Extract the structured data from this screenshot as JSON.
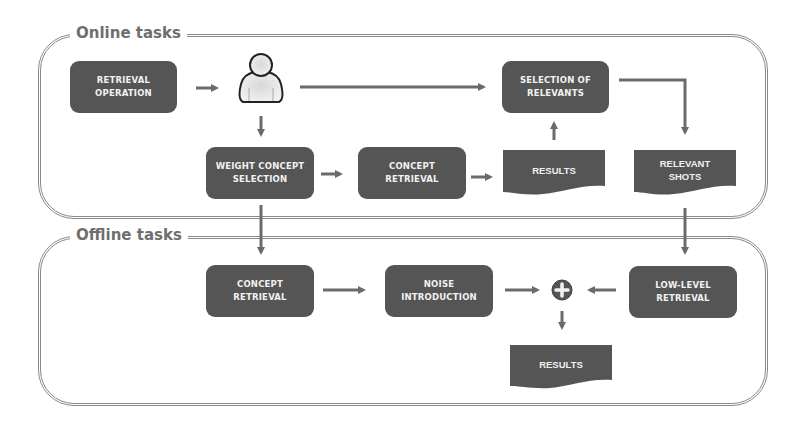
{
  "colors": {
    "node_fill": "#555555",
    "node_text": "#f2f2f2",
    "arrow": "#6b6b6b",
    "panel_border": "#8a8a8a",
    "panel_title": "#6e6e6e"
  },
  "panels": {
    "online": {
      "title": "Online tasks"
    },
    "offline": {
      "title": "Offline tasks"
    }
  },
  "online": {
    "retrieval_operation": "RETRIEVAL\nOPERATION",
    "user": {
      "icon": "user-icon"
    },
    "selection_of_relevants": "SELECTION OF\nRELEVANTS",
    "weight_concept_selection": "WEIGHT CONCEPT\nSELECTION",
    "concept_retrieval": "CONCEPT\nRETRIEVAL",
    "results": "RESULTS",
    "relevant_shots": "RELEVANT\nSHOTS"
  },
  "offline": {
    "concept_retrieval": "CONCEPT\nRETRIEVAL",
    "noise_introduction": "NOISE\nINTRODUCTION",
    "combine": {
      "icon": "plus-icon"
    },
    "low_level_retrieval": "LOW-LEVEL\nRETRIEVAL",
    "results": "RESULTS"
  },
  "edges": [
    [
      "Retrieval Operation",
      "User"
    ],
    [
      "User",
      "Selection of Relevants"
    ],
    [
      "User",
      "Weight Concept Selection"
    ],
    [
      "Weight Concept Selection",
      "Concept Retrieval (online)"
    ],
    [
      "Concept Retrieval (online)",
      "Results (online)"
    ],
    [
      "Results (online)",
      "Selection of Relevants"
    ],
    [
      "Selection of Relevants",
      "Relevant Shots"
    ],
    [
      "Weight Concept Selection",
      "Concept Retrieval (offline)"
    ],
    [
      "Relevant Shots",
      "Low-level Retrieval"
    ],
    [
      "Concept Retrieval (offline)",
      "Noise Introduction"
    ],
    [
      "Noise Introduction",
      "Combine"
    ],
    [
      "Low-level Retrieval",
      "Combine"
    ],
    [
      "Combine",
      "Results (offline)"
    ]
  ]
}
